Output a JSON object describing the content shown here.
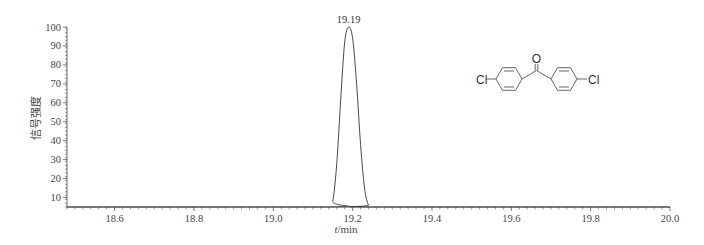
{
  "chart_data": {
    "type": "line",
    "title": "",
    "xlabel_italic": "t",
    "xlabel_unit": "/min",
    "xlabel": "t/min",
    "ylabel": "信号强度",
    "xlim": [
      18.48,
      20.0
    ],
    "ylim": [
      5,
      100
    ],
    "x_ticks": [
      18.6,
      18.8,
      19.0,
      19.2,
      19.4,
      19.6,
      19.8,
      20.0
    ],
    "x_tick_labels": [
      "18.6",
      "18.8",
      "19.0",
      "19.2",
      "19.4",
      "19.6",
      "19.8",
      "20.0"
    ],
    "y_ticks": [
      10,
      20,
      30,
      40,
      50,
      60,
      70,
      80,
      90,
      100
    ],
    "y_tick_labels": [
      "10",
      "20",
      "30",
      "40",
      "50",
      "60",
      "70",
      "80",
      "90",
      "100"
    ],
    "grid": false,
    "legend": null,
    "series": [
      {
        "name": "chromatogram",
        "x": [
          18.48,
          19.14,
          19.15,
          19.16,
          19.17,
          19.18,
          19.19,
          19.2,
          19.21,
          19.22,
          19.23,
          19.24,
          19.25,
          20.0
        ],
        "values": [
          5,
          5,
          8,
          28,
          62,
          92,
          100,
          94,
          70,
          38,
          15,
          6,
          5,
          5
        ]
      }
    ],
    "annotations": [
      {
        "text": "19.19",
        "x": 19.19,
        "y": 100,
        "type": "peak-label"
      }
    ]
  },
  "structure": {
    "name": "4,4'-dichlorobenzophenone",
    "left_atom": "Cl",
    "right_atom": "Cl",
    "top_atom": "O"
  },
  "colors": {
    "line": "#333333",
    "axis": "#555555",
    "text": "#444444"
  }
}
